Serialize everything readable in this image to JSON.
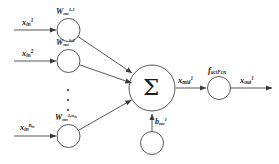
{
  "figure": {
    "type": "artificial-neuron-diagram",
    "background_color": "#ffffff",
    "stroke_color": "#3a3a3a",
    "text_color": "#1a1a1a"
  },
  "inputs": [
    {
      "id": "input-1",
      "label_base": "x",
      "label_sub": "in",
      "label_sup": "1",
      "weight_base": "W",
      "weight_sub": "nn",
      "weight_sup": "1,1"
    },
    {
      "id": "input-2",
      "label_base": "x",
      "label_sub": "in",
      "label_sup": "2",
      "weight_base": "W",
      "weight_sub": "nn",
      "weight_sup": "1,2"
    },
    {
      "id": "input-n",
      "label_base": "x",
      "label_sub": "in",
      "label_sup": "n",
      "label_sup_sub": "in",
      "weight_base": "W",
      "weight_sub": "nn",
      "weight_sup": "1,n",
      "weight_sup_sub": "in"
    }
  ],
  "ellipsis": {
    "name": "vertical-ellipsis",
    "dot_count": 3
  },
  "summation": {
    "symbol": "Σ",
    "name": "summation-node"
  },
  "bias": {
    "base": "b",
    "sub": "nn",
    "sup": "1"
  },
  "mid_signal": {
    "base": "x",
    "sub": "mid",
    "sup": "1"
  },
  "activation": {
    "base": "f",
    "sub": "actFcn"
  },
  "output": {
    "base": "x",
    "sub": "out",
    "sup": "1"
  }
}
